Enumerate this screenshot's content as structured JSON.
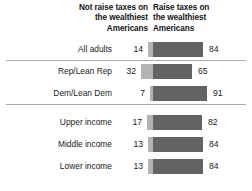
{
  "chart_data": {
    "type": "bar",
    "subtype": "diverging-stacked-bar",
    "title": "",
    "xlabel": "",
    "ylabel": "",
    "grid": false,
    "legend_position": "top",
    "units": "percent",
    "axis_split_x": 153,
    "pixels_per_unit": 0.76,
    "categories": [
      "All adults",
      "Rep/Lean Rep",
      "Dem/Lean Dem",
      "Upper income",
      "Middle income",
      "Lower income"
    ],
    "series": [
      {
        "name": "Not raise taxes on the wealthiest Americans",
        "color": "#b3b3b3",
        "side": "left",
        "values": [
          14,
          32,
          7,
          17,
          13,
          13
        ]
      },
      {
        "name": "Raise taxes on the wealthiest Americans",
        "color": "#636363",
        "side": "right",
        "values": [
          84,
          65,
          91,
          82,
          84,
          84
        ]
      }
    ],
    "group_dividers_after": [
      "All adults",
      "Dem/Lean Dem"
    ]
  },
  "header": {
    "left": {
      "lines": [
        "Not raise taxes on",
        "the wealthiest",
        "Americans"
      ]
    },
    "right": {
      "lines": [
        "Raise taxes on",
        "the wealthiest",
        "Americans"
      ]
    }
  },
  "rows": [
    {
      "label": "All adults",
      "left_value": "14",
      "right_value": "84"
    },
    {
      "label": "Rep/Lean Rep",
      "left_value": "32",
      "right_value": "65"
    },
    {
      "label": "Dem/Lean Dem",
      "left_value": "7",
      "right_value": "91"
    },
    {
      "label": "Upper income",
      "left_value": "17",
      "right_value": "82"
    },
    {
      "label": "Middle income",
      "left_value": "13",
      "right_value": "84"
    },
    {
      "label": "Lower income",
      "left_value": "13",
      "right_value": "84"
    }
  ],
  "colors": {
    "not_raise": "#b3b3b3",
    "raise": "#636363",
    "divider": "#a9a9a9",
    "text": "#1a1a1a",
    "background": "#ffffff"
  }
}
